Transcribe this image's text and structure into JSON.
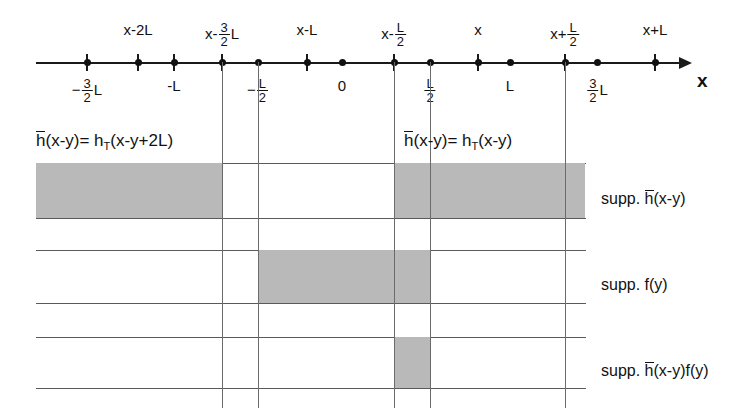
{
  "figure": {
    "axis": {
      "name": "x",
      "labels_above": [
        {
          "text": "x-2L",
          "x": 138
        },
        {
          "text": "x-",
          "frac": {
            "num": "3",
            "den": "2"
          },
          "suffix": "L",
          "x": 222
        },
        {
          "text": "x-L",
          "x": 307
        },
        {
          "text": "x-",
          "frac": {
            "num": "L",
            "den": "2"
          },
          "suffix": "",
          "x": 394
        },
        {
          "text": "x",
          "x": 478
        },
        {
          "text": "x+",
          "frac": {
            "num": "L",
            "den": "2"
          },
          "suffix": "",
          "x": 565
        },
        {
          "text": "x+L",
          "x": 655
        }
      ],
      "labels_below": [
        {
          "text": "−",
          "frac": {
            "num": "3",
            "den": "2"
          },
          "suffix": "L",
          "x": 87
        },
        {
          "text": "-L",
          "x": 174
        },
        {
          "text": "−",
          "frac": {
            "num": "L",
            "den": "2"
          },
          "suffix": "",
          "x": 258
        },
        {
          "text": "0",
          "x": 342
        },
        {
          "text": "",
          "frac": {
            "num": "L",
            "den": "2"
          },
          "suffix": "",
          "x": 430
        },
        {
          "text": "L",
          "x": 510
        },
        {
          "text": "",
          "frac": {
            "num": "3",
            "den": "2"
          },
          "suffix": "L",
          "x": 597
        }
      ],
      "ticks_with_bar": [
        87,
        138,
        174,
        222,
        307,
        394,
        478,
        565,
        655
      ],
      "ticks_dot_only": [
        258,
        342,
        430,
        510,
        597
      ]
    },
    "equations": [
      {
        "id": "eq-left",
        "lhs_bar": "h",
        "text": "(x-y)= h",
        "sub": "T",
        "tail": "(x-y+2L)",
        "x": 36,
        "y": 132
      },
      {
        "id": "eq-right",
        "lhs_bar": "h",
        "text": "(x-y)= h",
        "sub": "T",
        "tail": "(x-y)",
        "x": 404,
        "y": 132
      }
    ],
    "captions": [
      {
        "id": "caption-supp-h",
        "prefix": "supp. ",
        "bar": "h",
        "tail": "(x-y)",
        "y": 191
      },
      {
        "id": "caption-supp-f",
        "prefix": "supp. f(y)",
        "bar": "",
        "tail": "",
        "y": 277
      },
      {
        "id": "caption-supp-hf",
        "prefix": "supp. ",
        "bar": "h",
        "tail": "(x-y)f(y)",
        "y": 363
      }
    ],
    "vlines_x": [
      222,
      258,
      394,
      430,
      565
    ],
    "hrails_y": [
      163,
      218,
      250,
      303,
      337,
      388
    ],
    "blocks": [
      {
        "id": "block-h-left",
        "x": 36,
        "w": 186,
        "y": 163,
        "h": 55
      },
      {
        "id": "block-h-right",
        "x": 394,
        "w": 191,
        "y": 163,
        "h": 55
      },
      {
        "id": "block-f",
        "x": 258,
        "w": 172,
        "y": 250,
        "h": 53
      },
      {
        "id": "block-hf",
        "x": 394,
        "w": 36,
        "y": 337,
        "h": 51
      }
    ],
    "colors": {
      "shade": "#b9b9b9",
      "ink": "#111111",
      "rule": "#5a5a5a"
    }
  }
}
